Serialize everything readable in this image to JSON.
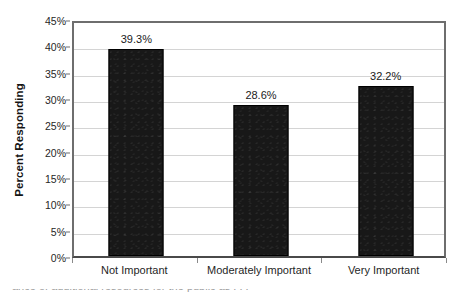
{
  "chart_data": {
    "type": "bar",
    "title": "",
    "xlabel": "",
    "ylabel": "Percent Responding",
    "categories": [
      "Not Important",
      "Moderately Important",
      "Very Important"
    ],
    "values": [
      39.3,
      28.6,
      32.2
    ],
    "data_labels": [
      "39.3%",
      "28.6%",
      "32.2%"
    ],
    "ylim": [
      0,
      45
    ],
    "ytick_values": [
      0,
      5,
      10,
      15,
      20,
      25,
      30,
      35,
      40,
      45
    ],
    "ytick_labels": [
      "0%",
      "5%",
      "10%",
      "15%",
      "20%",
      "25%",
      "30%",
      "35%",
      "40%",
      "45%"
    ],
    "grid": "horizontal",
    "legend": "none",
    "bar_color": "#181818",
    "gridline_color": "#d4d4d4",
    "axis_color": "#6e6e6e",
    "plot_background": "#ffffff"
  },
  "caption": {
    "cropped_line": "ance of additional resources for the public as . . ."
  }
}
